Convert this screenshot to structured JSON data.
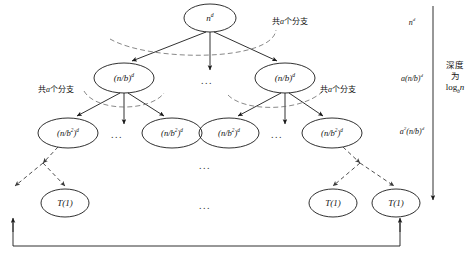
{
  "figure": {
    "kind": "recursion-tree",
    "background": "#ffffff",
    "stroke": "#1a1a1a",
    "dashed_stroke": "#5a5a5a"
  },
  "nodes": {
    "root": {
      "label_html": "n<sup>d</sup>",
      "plain": "n^d",
      "cx": 210,
      "cy": 18,
      "rx": 26,
      "ry": 14
    },
    "level2": [
      {
        "label_html": "(n/b)<sup>d</sup>",
        "plain": "(n/b)^d",
        "cx": 124,
        "cy": 78,
        "rx": 30,
        "ry": 15
      },
      {
        "label_html": "(n/b)<sup>d</sup>",
        "plain": "(n/b)^d",
        "cx": 285,
        "cy": 78,
        "rx": 30,
        "ry": 15
      }
    ],
    "level3": [
      {
        "label_html": "(n/b<sup>2</sup>)<sup>d</sup>",
        "plain": "(n/b^2)^d",
        "cx": 68,
        "cy": 133,
        "rx": 30,
        "ry": 15
      },
      {
        "label_html": "(n/b<sup>2</sup>)<sup>d</sup>",
        "plain": "(n/b^2)^d",
        "cx": 172,
        "cy": 133,
        "rx": 30,
        "ry": 15
      },
      {
        "label_html": "(n/b<sup>2</sup>)<sup>d</sup>",
        "plain": "(n/b^2)^d",
        "cx": 229,
        "cy": 133,
        "rx": 30,
        "ry": 15
      },
      {
        "label_html": "(n/b<sup>2</sup>)<sup>d</sup>",
        "plain": "(n/b^2)^d",
        "cx": 332,
        "cy": 133,
        "rx": 30,
        "ry": 15
      }
    ],
    "leaves": [
      {
        "label_html": "T(1)",
        "plain": "T(1)",
        "cx": 65,
        "cy": 203,
        "rx": 24,
        "ry": 14
      },
      {
        "label_html": "T(1)",
        "plain": "T(1)",
        "cx": 333,
        "cy": 203,
        "rx": 24,
        "ry": 14
      },
      {
        "label_html": "T(1)",
        "plain": "T(1)",
        "cx": 396,
        "cy": 203,
        "rx": 24,
        "ry": 14
      }
    ]
  },
  "branch_annotations": [
    {
      "text_prefix": "共",
      "var": "a",
      "text_suffix": "个分支",
      "full": "共a个分支",
      "cx": 290,
      "cy": 20
    },
    {
      "text_prefix": "共",
      "var": "a",
      "text_suffix": "个分支",
      "full": "共a个分支",
      "cx": 56,
      "cy": 88
    },
    {
      "text_prefix": "共",
      "var": "a",
      "text_suffix": "个分支",
      "full": "共a个分支",
      "cx": 338,
      "cy": 88
    }
  ],
  "level_costs": [
    {
      "label_html": "n<sup>d</sup>",
      "plain": "n^d",
      "cx": 412,
      "cy": 22
    },
    {
      "label_html": "a(n/b)<sup>d</sup>",
      "plain": "a(n/b)^d",
      "cx": 412,
      "cy": 78
    },
    {
      "label_html": "a<sup>2</sup>(n/b)<sup>d</sup>",
      "plain": "a^2(n/b)^d",
      "cx": 412,
      "cy": 131
    }
  ],
  "depth_annotation": {
    "lines": [
      "深度",
      "为"
    ],
    "math_html": "log<sub>b</sub><i>n</i>",
    "math_plain": "log_b n",
    "cx": 455,
    "cy": 76
  },
  "ellipses": [
    {
      "text": "...",
      "cx": 207,
      "cy": 80
    },
    {
      "text": "...",
      "cx": 117,
      "cy": 134
    },
    {
      "text": "...",
      "cx": 277,
      "cy": 134
    },
    {
      "text": "...",
      "cx": 205,
      "cy": 165
    },
    {
      "text": "...",
      "cx": 205,
      "cy": 205
    }
  ],
  "bottom_bracket": {
    "description": "bracket spanning leaf row with upward arrows at both ends",
    "left_x": 13,
    "right_x": 400,
    "bottom_y": 246,
    "top_y": 218
  }
}
